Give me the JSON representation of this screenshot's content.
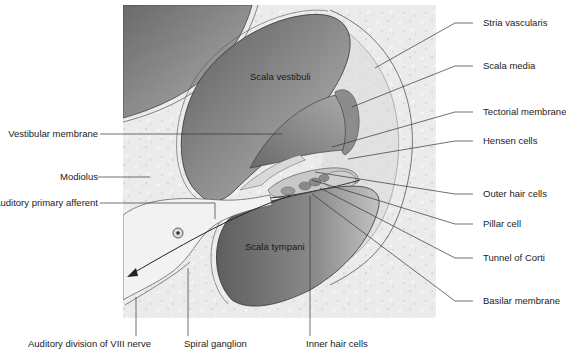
{
  "figure": {
    "colors": {
      "background": "#ffffff",
      "bone": "#ececec",
      "scala_dark": "#6e6e6e",
      "scala_light": "#bdbdbd",
      "stria": "#8a8a8a",
      "membrane_line": "#3a3a3a",
      "nerve": "#f2f2f2"
    }
  },
  "internal_labels": {
    "scala_vestibuli": "Scala vestibuli",
    "scala_tympani": "Scala tympani"
  },
  "left_labels": [
    {
      "id": "vestibular-membrane",
      "text": "Vestibular membrane"
    },
    {
      "id": "modiolus",
      "text": "Modiolus"
    },
    {
      "id": "auditory-primary-afferent",
      "text": "Auditory primary afferent"
    }
  ],
  "right_labels": [
    {
      "id": "stria-vascularis",
      "text": "Stria vascularis"
    },
    {
      "id": "scala-media",
      "text": "Scala media"
    },
    {
      "id": "tectorial-membrane",
      "text": "Tectorial membrane"
    },
    {
      "id": "hensen-cells",
      "text": "Hensen cells"
    },
    {
      "id": "outer-hair-cells",
      "text": "Outer hair cells"
    },
    {
      "id": "pillar-cell",
      "text": "Pillar cell"
    },
    {
      "id": "tunnel-of-corti",
      "text": "Tunnel of Corti"
    },
    {
      "id": "basilar-membrane",
      "text": "Basilar membrane"
    }
  ],
  "bottom_labels": [
    {
      "id": "auditory-division-viii",
      "text": "Auditory division of VIII nerve"
    },
    {
      "id": "spiral-ganglion",
      "text": "Spiral ganglion"
    },
    {
      "id": "inner-hair-cells",
      "text": "Inner hair cells"
    }
  ]
}
